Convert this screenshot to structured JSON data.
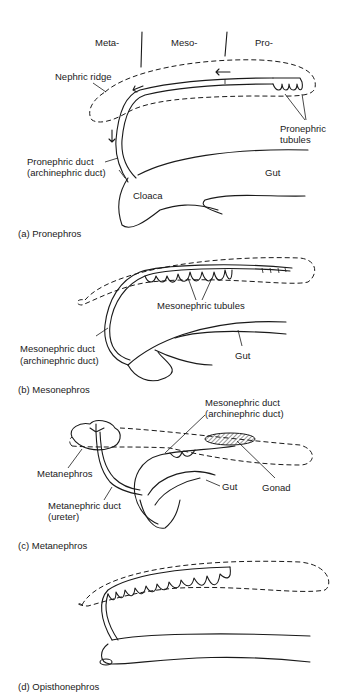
{
  "figure": {
    "panels": [
      {
        "id": "a",
        "caption": "(a) Pronephros",
        "labels": {
          "region_meta": "Meta-",
          "region_meso": "Meso-",
          "region_pro": "Pro-",
          "nephric_ridge": "Nephric ridge",
          "pronephric_tubules_1": "Pronephric",
          "pronephric_tubules_2": "tubules",
          "pronephric_duct_1": "Pronephric duct",
          "pronephric_duct_2": "(archinephric duct)",
          "cloaca": "Cloaca",
          "gut": "Gut"
        }
      },
      {
        "id": "b",
        "caption": "(b) Mesonephros",
        "labels": {
          "mesonephric_tubules": "Mesonephric tubules",
          "mesonephric_duct_1": "Mesonephric duct",
          "mesonephric_duct_2": "(archinephric duct)",
          "gut": "Gut"
        }
      },
      {
        "id": "c",
        "caption": "(c) Metanephros",
        "labels": {
          "mesonephric_duct_1": "Mesonephric duct",
          "mesonephric_duct_2": "(archinephric duct)",
          "metanephros": "Metanephros",
          "metanephric_duct_1": "Metanephric duct",
          "metanephric_duct_2": "(ureter)",
          "gut": "Gut",
          "gonad": "Gonad"
        }
      },
      {
        "id": "d",
        "caption": "(d) Opisthonephros",
        "labels": {}
      }
    ]
  }
}
